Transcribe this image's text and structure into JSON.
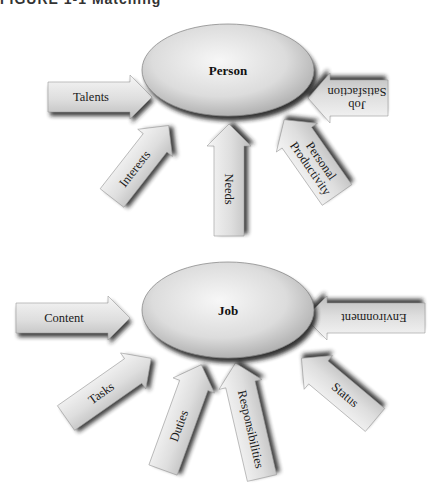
{
  "caption": "FIGURE 1-1 Matching",
  "diagrams": [
    {
      "name": "person-diagram",
      "center": {
        "label": "Person",
        "cx": 228,
        "cy": 70,
        "rx": 86,
        "ry": 46
      },
      "arrows": [
        {
          "label": "Talents",
          "lines": [
            "Talents"
          ],
          "x": 48,
          "y": 97,
          "len": 104,
          "angle": 0,
          "w": 30
        },
        {
          "label": "Interests",
          "lines": [
            "Interests"
          ],
          "x": 112,
          "y": 198,
          "len": 92,
          "angle": -52,
          "w": 30
        },
        {
          "label": "Needs",
          "lines": [
            "Needs"
          ],
          "x": 229,
          "y": 236,
          "len": 112,
          "angle": -90,
          "w": 30
        },
        {
          "label": "Personal Productivity",
          "lines": [
            "Personal",
            "Productivity"
          ],
          "x": 337,
          "y": 195,
          "len": 92,
          "angle": -125,
          "w": 36
        },
        {
          "label": "Job Satisfaction",
          "lines": [
            "Job",
            "Satisfaction"
          ],
          "x": 388,
          "y": 98,
          "len": 80,
          "angle": 180,
          "w": 36
        }
      ]
    },
    {
      "name": "job-diagram",
      "center": {
        "label": "Job",
        "cx": 228,
        "cy": 310,
        "rx": 86,
        "ry": 48
      },
      "arrows": [
        {
          "label": "Content",
          "lines": [
            "Content"
          ],
          "x": 16,
          "y": 318,
          "len": 114,
          "angle": 0,
          "w": 30
        },
        {
          "label": "Tasks",
          "lines": [
            "Tasks"
          ],
          "x": 66,
          "y": 418,
          "len": 104,
          "angle": -35,
          "w": 30
        },
        {
          "label": "Duties",
          "lines": [
            "Duties"
          ],
          "x": 163,
          "y": 470,
          "len": 112,
          "angle": -70,
          "w": 30
        },
        {
          "label": "Responsibilities",
          "lines": [
            "Responsibilities"
          ],
          "x": 262,
          "y": 478,
          "len": 118,
          "angle": -103,
          "w": 30
        },
        {
          "label": "Status",
          "lines": [
            "Status"
          ],
          "x": 375,
          "y": 420,
          "len": 96,
          "angle": -140,
          "w": 30
        },
        {
          "label": "Environment",
          "lines": [
            "Environment"
          ],
          "x": 425,
          "y": 318,
          "len": 120,
          "angle": 180,
          "w": 30
        }
      ]
    }
  ],
  "colors": {
    "ellipse_light": "#f2f2f2",
    "ellipse_mid": "#cfcfcf",
    "ellipse_dark": "#9a9a9a",
    "arrow_light": "#f0f0f0",
    "arrow_dark": "#b8b8b8",
    "shadow": "#1e1e1e"
  }
}
